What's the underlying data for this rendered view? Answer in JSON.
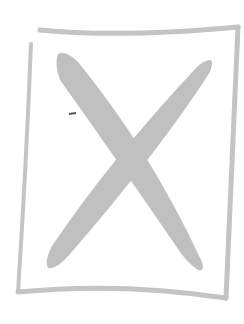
{
  "image": {
    "subject": "hand-drawn X inside a rectangular frame",
    "icon": "x-placeholder-icon",
    "colors": {
      "background": "#ffffff",
      "frame": "#c4c4c4",
      "cross": "#c0c0c0",
      "mark": "#555555"
    }
  }
}
